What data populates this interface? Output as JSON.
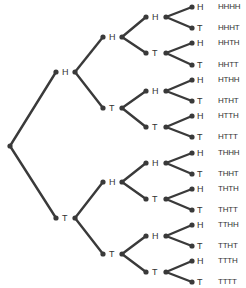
{
  "diagram": {
    "type": "probability-tree",
    "colors": {
      "line": "#3a3a3a",
      "node": "#3a3a3a",
      "text": "#333333"
    },
    "root": {
      "x": 10,
      "y": 146
    },
    "level1": [
      {
        "label": "H",
        "x": 56,
        "y": 72,
        "bx": 75
      },
      {
        "label": "T",
        "x": 56,
        "y": 218,
        "bx": 75
      }
    ],
    "level2": [
      {
        "label": "H",
        "x": 103,
        "y": 37,
        "bx": 122,
        "parent": 0
      },
      {
        "label": "T",
        "x": 103,
        "y": 108,
        "bx": 122,
        "parent": 0
      },
      {
        "label": "H",
        "x": 103,
        "y": 182,
        "bx": 122,
        "parent": 1
      },
      {
        "label": "T",
        "x": 103,
        "y": 254,
        "bx": 122,
        "parent": 1
      }
    ],
    "level3": [
      {
        "label": "H",
        "x": 146,
        "y": 17,
        "bx": 166,
        "parent": 0
      },
      {
        "label": "T",
        "x": 146,
        "y": 53,
        "bx": 166,
        "parent": 0
      },
      {
        "label": "H",
        "x": 146,
        "y": 91,
        "bx": 166,
        "parent": 1
      },
      {
        "label": "T",
        "x": 146,
        "y": 127,
        "bx": 166,
        "parent": 1
      },
      {
        "label": "H",
        "x": 146,
        "y": 163,
        "bx": 166,
        "parent": 2
      },
      {
        "label": "T",
        "x": 146,
        "y": 199,
        "bx": 166,
        "parent": 2
      },
      {
        "label": "H",
        "x": 146,
        "y": 236,
        "bx": 166,
        "parent": 3
      },
      {
        "label": "T",
        "x": 146,
        "y": 272,
        "bx": 166,
        "parent": 3
      }
    ],
    "leaves": [
      {
        "label": "H",
        "outcome": "HHHH",
        "y": 7
      },
      {
        "label": "T",
        "outcome": "HHHT",
        "y": 28
      },
      {
        "label": "H",
        "outcome": "HHTH",
        "y": 43
      },
      {
        "label": "T",
        "outcome": "HHTT",
        "y": 65
      },
      {
        "label": "H",
        "outcome": "HTHH",
        "y": 80
      },
      {
        "label": "T",
        "outcome": "HTHT",
        "y": 101
      },
      {
        "label": "H",
        "outcome": "HTTH",
        "y": 116
      },
      {
        "label": "T",
        "outcome": "HTTT",
        "y": 137
      },
      {
        "label": "H",
        "outcome": "THHH",
        "y": 153
      },
      {
        "label": "T",
        "outcome": "THHT",
        "y": 174
      },
      {
        "label": "H",
        "outcome": "THTH",
        "y": 189
      },
      {
        "label": "T",
        "outcome": "THTT",
        "y": 210
      },
      {
        "label": "H",
        "outcome": "TTHH",
        "y": 225
      },
      {
        "label": "T",
        "outcome": "TTHT",
        "y": 246
      },
      {
        "label": "H",
        "outcome": "TTTH",
        "y": 261
      },
      {
        "label": "T",
        "outcome": "TTTT",
        "y": 282
      }
    ]
  }
}
